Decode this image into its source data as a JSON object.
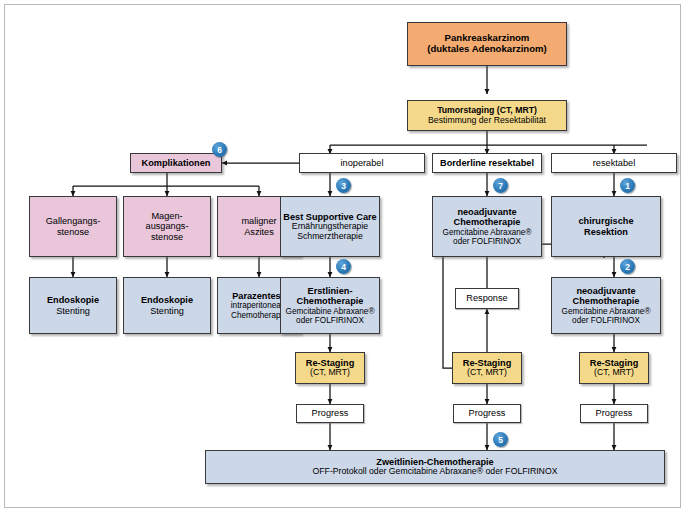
{
  "diagram": {
    "title_node": "Pankreaskarzinom (duktales Adenokarzinom)",
    "language": "de",
    "accent_badge_color": "#2b7ab8",
    "palette": {
      "orange": "#f3ab72",
      "yellow": "#f5d98b",
      "pink": "#e9c6da",
      "blue": "#ccd7e8",
      "white": "#ffffff",
      "border": "#39393b"
    }
  },
  "nodes": {
    "pankreaskarzinom": {
      "line1": "Pankreaskarzinom",
      "line2": "(duktales Adenokarzinom)"
    },
    "tumorstaging": {
      "line1": "Tumorstaging (CT, MRT)",
      "line2": "Bestimmung der Resektabilität"
    },
    "komplikationen": {
      "line1": "Komplikationen"
    },
    "inoperabel": {
      "line1": "inoperabel"
    },
    "borderline": {
      "line1": "Borderline resektabel"
    },
    "resektabel": {
      "line1": "resektabel"
    },
    "gallengangsstenose": {
      "line1": "Gallengangs-",
      "line2": "stenose"
    },
    "magenausgangsstenose": {
      "line1": "Magen-",
      "line2": "ausgangs-",
      "line3": "stenose"
    },
    "maligner_aszites": {
      "line1": "maligner",
      "line2": "Aszites"
    },
    "endoskopie_1": {
      "line1": "Endoskopie",
      "line2": "Stenting"
    },
    "endoskopie_2": {
      "line1": "Endoskopie",
      "line2": "Stenting"
    },
    "parazentese": {
      "line1": "Parazentese",
      "line2": "intraperitoneale",
      "line3": "Chemotherapie"
    },
    "best_supportive_care": {
      "line1": "Best Supportive Care",
      "line2": "Ernährungstherapie",
      "line3": "Schmerztherapie"
    },
    "neoadjuvante_border": {
      "line1": "neoadjuvante",
      "line2": "Chemotherapie",
      "line3": "Gemcitabine Abraxane®",
      "line4": "oder FOLFIRINOX"
    },
    "chirurgische_resektion": {
      "line1": "chirurgische",
      "line2": "Resektion"
    },
    "erstlinien_chemo": {
      "line1": "Erstlinien-",
      "line2": "Chemotherapie",
      "line3": "Gemcitabine Abraxane®",
      "line4": "oder FOLFIRINOX"
    },
    "response": {
      "line1": "Response"
    },
    "neoadjuvante_resekt": {
      "line1": "neoadjuvante",
      "line2": "Chemotherapie",
      "line3": "Gemcitabine Abraxane®",
      "line4": "oder FOLFIRINOX"
    },
    "restaging_left": {
      "line1": "Re-Staging",
      "line2": "(CT, MRT)"
    },
    "restaging_mid": {
      "line1": "Re-Staging",
      "line2": "(CT, MRT)"
    },
    "restaging_right": {
      "line1": "Re-Staging",
      "line2": "(CT, MRT)"
    },
    "progress_left": {
      "line1": "Progress"
    },
    "progress_mid": {
      "line1": "Progress"
    },
    "progress_right": {
      "line1": "Progress"
    },
    "zweitlinien_chemo": {
      "line1": "Zweitlinien-Chemotherapie",
      "line2": "OFF-Protokoll oder Gemcitabine Abraxane® oder FOLFIRINOX"
    }
  },
  "badges": {
    "b1": "1",
    "b2": "2",
    "b3": "3",
    "b4": "4",
    "b5": "5",
    "b6": "6",
    "b7": "7"
  }
}
